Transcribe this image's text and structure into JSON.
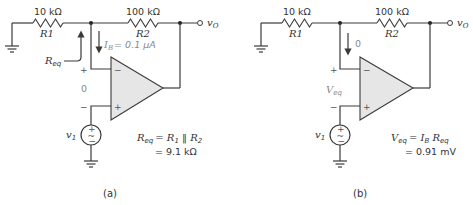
{
  "figures": [
    {
      "caption": "(a)",
      "r1": {
        "value": "10 kΩ",
        "name": "R1"
      },
      "r2": {
        "value": "100 kΩ",
        "name": "R2"
      },
      "output_label": "v",
      "output_sub": "O",
      "source_label": "v",
      "source_sub": "1",
      "current_label_var": "I",
      "current_label_sub": "B",
      "current_label_value": "= 0.1 μA",
      "req_label": "R",
      "req_sub": "eq",
      "input_plus": "+",
      "input_minus": "−",
      "input_value": "0",
      "opamp_minus": "−",
      "opamp_plus": "+",
      "eq_line1_lhs": "R",
      "eq_line1_lhs_sub": "eq",
      "eq_line1_rhs": "= R",
      "eq_line1_rhs_sub1": "1",
      "eq_line1_par": " ‖ R",
      "eq_line1_rhs_sub2": "2",
      "eq_line2": "= 9.1 kΩ"
    },
    {
      "caption": "(b)",
      "r1": {
        "value": "10 kΩ",
        "name": "R1"
      },
      "r2": {
        "value": "100 kΩ",
        "name": "R2"
      },
      "output_label": "v",
      "output_sub": "O",
      "source_label": "v",
      "source_sub": "1",
      "current_label_value": "0",
      "veq_label": "V",
      "veq_sub": "eq",
      "input_plus": "+",
      "input_minus": "−",
      "opamp_minus": "−",
      "opamp_plus": "+",
      "eq_line1_lhs": "V",
      "eq_line1_lhs_sub": "eq",
      "eq_line1_rhs": "= I",
      "eq_line1_rhs_sub1": "B",
      "eq_line1_r": " R",
      "eq_line1_rhs_sub2": "eq",
      "eq_line2": "= 0.91 mV"
    }
  ]
}
